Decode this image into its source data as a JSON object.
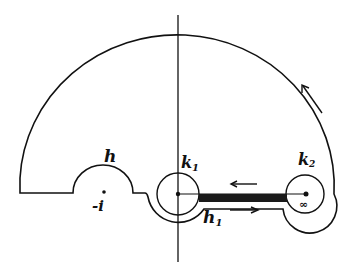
{
  "diagram": {
    "type": "contour-integration-path",
    "labels": {
      "h": "h",
      "k1_main": "k",
      "k1_sub": "1",
      "k2_main": "k",
      "k2_sub": "2",
      "h1_main": "h",
      "h1_sub": "1",
      "minus_i": "-i",
      "infinity": "∞"
    },
    "arrows": [
      {
        "name": "outer-arc-arrow",
        "direction": "counterclockwise"
      },
      {
        "name": "upper-cut-arrow",
        "direction": "left"
      },
      {
        "name": "lower-cut-arrow",
        "direction": "right"
      }
    ],
    "colors": {
      "stroke": "#111111",
      "background": "#ffffff"
    }
  }
}
